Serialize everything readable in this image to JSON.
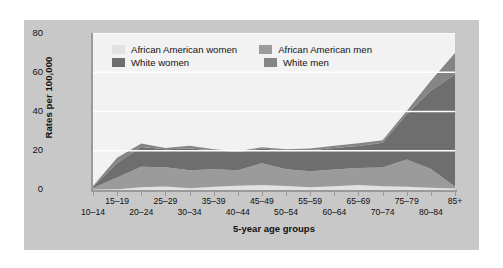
{
  "figure": {
    "panel_color": "#c8c8c8",
    "plot_background": "#f2f2f2",
    "gridline_color": "#ffffff",
    "axis_color": "#9a9a9a"
  },
  "legend": {
    "entries": [
      {
        "label": "African American women",
        "color": "#e2e2e2"
      },
      {
        "label": "African American men",
        "color": "#9b9b9b"
      },
      {
        "label": "White women",
        "color": "#6e6e6e"
      },
      {
        "label": "White men",
        "color": "#858585"
      }
    ]
  },
  "chart_data": {
    "type": "area",
    "stacked": true,
    "title": "",
    "xlabel": "5-year age groups",
    "ylabel": "Rates per 100,000",
    "ylim": [
      0,
      80
    ],
    "yticks": [
      0,
      20,
      40,
      60,
      80
    ],
    "grid": true,
    "legend_position": "upper-left-inside",
    "categories": [
      "10-14",
      "15-19",
      "20-24",
      "25-29",
      "30-34",
      "35-39",
      "40-44",
      "45-49",
      "50-54",
      "55-59",
      "60-64",
      "65-69",
      "70-74",
      "75-79",
      "80-84",
      "85+"
    ],
    "series": [
      {
        "name": "African American women",
        "color": "#e2e2e2",
        "values": [
          0.2,
          0.4,
          1.4,
          1.8,
          0.9,
          1.6,
          2.2,
          2.6,
          2.0,
          1.4,
          1.9,
          2.6,
          1.9,
          1.6,
          1.2,
          0.8
        ]
      },
      {
        "name": "African American men",
        "color": "#9b9b9b",
        "values": [
          0.8,
          6.0,
          10.5,
          9.8,
          9.2,
          9.0,
          7.9,
          11.0,
          8.6,
          8.2,
          8.5,
          8.6,
          9.6,
          14.0,
          9.5,
          1.0
        ]
      },
      {
        "name": "White women",
        "color": "#6e6e6e",
        "values": [
          0.6,
          7.4,
          10.0,
          9.2,
          11.0,
          9.6,
          9.3,
          7.6,
          9.4,
          10.6,
          11.0,
          11.2,
          12.6,
          23.0,
          40.0,
          57.0
        ]
      },
      {
        "name": "White men",
        "color": "#858585",
        "values": [
          0.4,
          2.6,
          1.8,
          0.6,
          1.5,
          0.6,
          0.4,
          0.6,
          0.8,
          1.0,
          1.2,
          1.4,
          1.3,
          1.6,
          5.0,
          11.0
        ]
      }
    ],
    "totals_note": "Topmost stacked value reaches about 70 per 100,000 at the 85+ age group"
  },
  "axes": {
    "ytick_labels": [
      "0",
      "20",
      "40",
      "60",
      "80"
    ],
    "xtick_labels_top": [
      "15-19",
      "25-29",
      "35-39",
      "45-49",
      "55-59",
      "65-69",
      "75-79",
      "85+"
    ],
    "xtick_labels_bottom": [
      "10-14",
      "20-24",
      "30-34",
      "40-44",
      "50-54",
      "60-64",
      "70-74",
      "80-84"
    ]
  }
}
